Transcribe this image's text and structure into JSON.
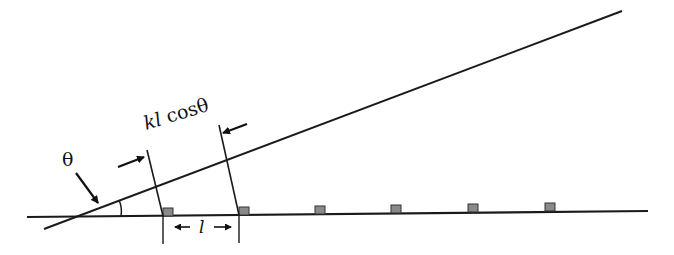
{
  "diagram": {
    "title": "",
    "labels": {
      "angle": "θ",
      "projection_k": "k",
      "projection_l": "l",
      "projection_cos": " cosθ",
      "spacing": "l"
    },
    "colors": {
      "line": "#1a1a1a",
      "element_fill": "#8a8a8a",
      "element_stroke": "#333333"
    },
    "baseline": {
      "x1": 27,
      "y1": 217,
      "x2": 648,
      "y2": 211
    },
    "incident_line": {
      "x1": 44,
      "y1": 229,
      "x2": 622,
      "y2": 11
    },
    "elements_count": 6
  }
}
